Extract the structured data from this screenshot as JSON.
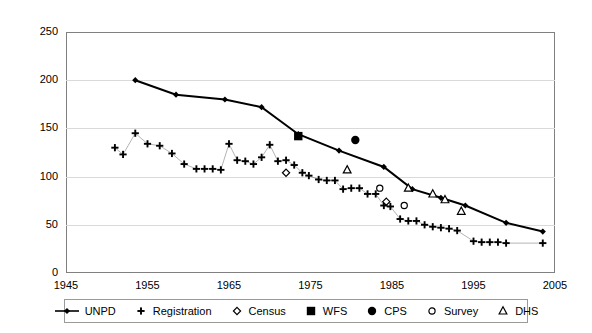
{
  "chart_data": {
    "type": "scatter",
    "title": "",
    "xlabel": "",
    "ylabel": "",
    "xlim": [
      1945,
      2005
    ],
    "ylim": [
      0,
      250
    ],
    "xticks": [
      1945,
      1955,
      1965,
      1975,
      1985,
      1995,
      2005
    ],
    "yticks": [
      0,
      50,
      100,
      150,
      200,
      250
    ],
    "grid": "horizontal",
    "legend_position": "bottom",
    "series": [
      {
        "name": "UNPD",
        "marker": "filled-diamond",
        "line": true,
        "points": [
          [
            1953.5,
            200
          ],
          [
            1958.5,
            185
          ],
          [
            1964.5,
            180
          ],
          [
            1969.0,
            172
          ],
          [
            1973.5,
            144
          ],
          [
            1978.5,
            127
          ],
          [
            1984.0,
            110
          ],
          [
            1987.5,
            87
          ],
          [
            1991.0,
            78
          ],
          [
            1994.0,
            70
          ],
          [
            1999.0,
            52
          ],
          [
            2003.5,
            43
          ]
        ]
      },
      {
        "name": "Registration",
        "marker": "plus",
        "line": true,
        "points": [
          [
            1951.0,
            130
          ],
          [
            1952.0,
            123
          ],
          [
            1953.5,
            145
          ],
          [
            1955.0,
            134
          ],
          [
            1956.5,
            132
          ],
          [
            1958.0,
            124
          ],
          [
            1959.5,
            113
          ],
          [
            1961.0,
            108
          ],
          [
            1962.0,
            108
          ],
          [
            1963.0,
            108
          ],
          [
            1964.0,
            107
          ],
          [
            1965.0,
            134
          ],
          [
            1966.0,
            117
          ],
          [
            1967.0,
            116
          ],
          [
            1968.0,
            113
          ],
          [
            1969.0,
            120
          ],
          [
            1970.0,
            133
          ],
          [
            1971.0,
            116
          ],
          [
            1972.0,
            117
          ],
          [
            1973.0,
            112
          ],
          [
            1974.0,
            104
          ],
          [
            1974.8,
            101
          ],
          [
            1976.0,
            97
          ],
          [
            1977.0,
            96
          ],
          [
            1978.0,
            96
          ],
          [
            1979.0,
            87
          ],
          [
            1980.0,
            88
          ],
          [
            1981.0,
            88
          ],
          [
            1982.0,
            82
          ],
          [
            1983.0,
            82
          ],
          [
            1984.0,
            70
          ],
          [
            1984.8,
            69
          ],
          [
            1986.0,
            56
          ],
          [
            1987.0,
            54
          ],
          [
            1988.0,
            54
          ],
          [
            1989.0,
            50
          ],
          [
            1990.0,
            48
          ],
          [
            1991.0,
            47
          ],
          [
            1992.0,
            46
          ],
          [
            1993.0,
            44
          ],
          [
            1995.0,
            33
          ],
          [
            1996.0,
            32
          ],
          [
            1997.0,
            32
          ],
          [
            1998.0,
            32
          ],
          [
            1999.0,
            31
          ],
          [
            2003.5,
            31
          ]
        ]
      },
      {
        "name": "Census",
        "marker": "open-diamond",
        "line": false,
        "points": [
          [
            1972.0,
            104
          ],
          [
            1984.3,
            74
          ]
        ]
      },
      {
        "name": "WFS",
        "marker": "filled-square",
        "line": false,
        "points": [
          [
            1973.5,
            142
          ]
        ]
      },
      {
        "name": "CPS",
        "marker": "filled-circle",
        "line": false,
        "points": [
          [
            1980.5,
            138
          ]
        ]
      },
      {
        "name": "Survey",
        "marker": "open-circle",
        "line": false,
        "points": [
          [
            1983.5,
            88
          ],
          [
            1986.5,
            70
          ]
        ]
      },
      {
        "name": "DHS",
        "marker": "open-triangle",
        "line": false,
        "points": [
          [
            1979.5,
            107
          ],
          [
            1987.0,
            88
          ],
          [
            1990.0,
            82
          ],
          [
            1991.5,
            76
          ],
          [
            1993.5,
            64
          ]
        ]
      }
    ]
  },
  "axes": {
    "y_labels": [
      "250",
      "200",
      "150",
      "100",
      "50",
      "0"
    ],
    "x_labels": [
      "1945",
      "1955",
      "1965",
      "1975",
      "1985",
      "1995",
      "2005"
    ]
  },
  "legend": {
    "items": [
      {
        "label": "UNPD",
        "marker": "line-filled-diamond"
      },
      {
        "label": "Registration",
        "marker": "plus"
      },
      {
        "label": "Census",
        "marker": "open-diamond"
      },
      {
        "label": "WFS",
        "marker": "filled-square"
      },
      {
        "label": "CPS",
        "marker": "filled-circle"
      },
      {
        "label": "Survey",
        "marker": "open-circle"
      },
      {
        "label": "DHS",
        "marker": "open-triangle"
      }
    ]
  },
  "colors": {
    "series": "#000000",
    "grid": "#d9d9d9",
    "frame": "#808080",
    "background": "#ffffff"
  }
}
